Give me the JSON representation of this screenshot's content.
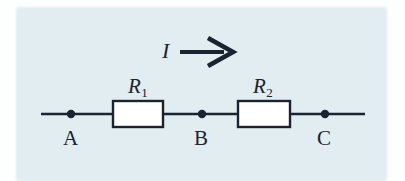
{
  "figure": {
    "kind": "circuit-diagram",
    "background_color": "#e2edf1",
    "ink_color": "#1b2330",
    "component_fill": "#ffffff"
  },
  "current": {
    "symbol": "I",
    "arrow_direction": "right",
    "arrow_icon": "arrow-right-icon"
  },
  "resistors": [
    {
      "id": "r1",
      "symbol": "R",
      "subscript": "1"
    },
    {
      "id": "r2",
      "symbol": "R",
      "subscript": "2"
    }
  ],
  "nodes": [
    {
      "id": "a",
      "label": "A"
    },
    {
      "id": "b",
      "label": "B"
    },
    {
      "id": "c",
      "label": "C"
    }
  ]
}
